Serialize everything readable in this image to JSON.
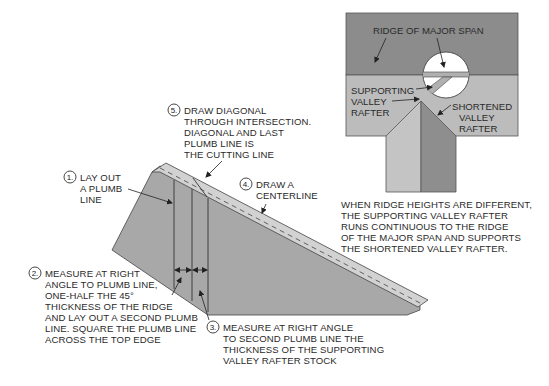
{
  "colors": {
    "dark_gray": "#8c8c8c",
    "mid_gray": "#a9a9a9",
    "light_gray": "#c2c2c2",
    "top_edge": "#d2d2d2",
    "outline": "#444444",
    "text": "#2a2a2a"
  },
  "rafter_diagram": {
    "steps": [
      {
        "num": "1.",
        "lines": [
          "LAY OUT",
          "A PLUMB",
          "LINE"
        ]
      },
      {
        "num": "2.",
        "lines": [
          "MEASURE AT RIGHT",
          "ANGLE TO PLUMB LINE,",
          "ONE-HALF THE 45°",
          "THICKNESS OF THE RIDGE",
          "AND LAY OUT A SECOND PLUMB",
          "LINE.  SQUARE THE PLUMB LINE",
          "ACROSS THE TOP EDGE"
        ]
      },
      {
        "num": "3.",
        "lines": [
          "MEASURE AT RIGHT ANGLE",
          "TO SECOND PLUMB LINE THE",
          "THICKNESS OF THE SUPPORTING",
          "VALLEY RAFTER STOCK"
        ]
      },
      {
        "num": "4.",
        "lines": [
          "DRAW A",
          "CENTERLINE"
        ]
      },
      {
        "num": "5.",
        "lines": [
          "DRAW DIAGONAL",
          "THROUGH INTERSECTION.",
          "DIAGONAL AND LAST",
          "PLUMB LINE IS",
          "THE CUTTING LINE"
        ]
      }
    ]
  },
  "plan_diagram": {
    "labels": {
      "ridge": "RIDGE OF MAJOR SPAN",
      "supporting": [
        "SUPPORTING",
        "VALLEY",
        "RAFTER"
      ],
      "shortened": [
        "SHORTENED",
        "VALLEY",
        "RAFTER"
      ]
    },
    "caption": [
      "WHEN RIDGE HEIGHTS ARE DIFFERENT,",
      "THE SUPPORTING VALLEY RAFTER",
      "RUNS CONTINUOUS TO THE RIDGE",
      "OF THE MAJOR SPAN AND SUPPORTS",
      "THE SHORTENED VALLEY RAFTER."
    ]
  }
}
